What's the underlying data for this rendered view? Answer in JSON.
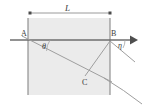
{
  "figure": {
    "name": "refraction-geometry-diagram",
    "background": "#ffffff",
    "slab_fill": "#ebebeb",
    "line_color": "#8c8c8c",
    "axis_color": "#6e6e6e",
    "label_color": "#3a3a3a"
  },
  "dimension": {
    "label": "L",
    "x_start": 30,
    "x_end": 110,
    "y": 13
  },
  "points": {
    "a": {
      "label": "A",
      "x": 28,
      "y": 40
    },
    "b": {
      "label": "B",
      "x": 110,
      "y": 40
    },
    "c": {
      "label": "C",
      "x": 85,
      "y": 78
    }
  },
  "angles": {
    "theta": {
      "label": "θ",
      "vertex": "A",
      "x": 44,
      "y": 48
    },
    "eta": {
      "label": "η",
      "vertex": "B",
      "x": 120,
      "y": 46
    }
  },
  "slab": {
    "left": 28,
    "right": 110,
    "top": 18,
    "bottom": 95
  },
  "axis": {
    "x_start": 10,
    "x_end": 131,
    "y": 40,
    "arrow_tip_x": 138
  },
  "rays": {
    "incident_label": "ray-from-A-through-C",
    "chord_label": "segment-C-to-B",
    "exit_label": "curved-exit-ray"
  }
}
